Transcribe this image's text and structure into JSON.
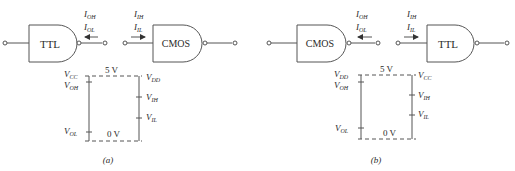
{
  "figure": {
    "panels": [
      {
        "id": "a",
        "caption": "(a)",
        "driver_gate": {
          "label": "TTL",
          "type": "NAND"
        },
        "load_gate": {
          "label": "CMOS",
          "type": "NAND"
        },
        "output_currents": {
          "line1": "I",
          "sub1": "OH",
          "line2": "I",
          "sub2": "OL",
          "arrow": "left"
        },
        "input_currents": {
          "line1": "I",
          "sub1": "IH",
          "line2": "I",
          "sub2": "IL",
          "arrow": "right"
        },
        "levels": {
          "top_label": "5 V",
          "bottom_label": "0 V",
          "left": [
            {
              "name": "V",
              "sub": "CC"
            },
            {
              "name": "V",
              "sub": "OH"
            },
            {
              "name": "V",
              "sub": "OL"
            }
          ],
          "right": [
            {
              "name": "V",
              "sub": "DD"
            },
            {
              "name": "V",
              "sub": "IH"
            },
            {
              "name": "V",
              "sub": "IL"
            }
          ]
        }
      },
      {
        "id": "b",
        "caption": "(b)",
        "driver_gate": {
          "label": "CMOS",
          "type": "NAND"
        },
        "load_gate": {
          "label": "TTL",
          "type": "NAND"
        },
        "output_currents": {
          "line1": "I",
          "sub1": "OH",
          "line2": "I",
          "sub2": "OL",
          "arrow": "left"
        },
        "input_currents": {
          "line1": "I",
          "sub1": "IH",
          "line2": "I",
          "sub2": "IL",
          "arrow": "right"
        },
        "levels": {
          "top_label": "5 V",
          "bottom_label": "0 V",
          "left": [
            {
              "name": "V",
              "sub": "DD"
            },
            {
              "name": "V",
              "sub": "OH"
            },
            {
              "name": "V",
              "sub": "OL"
            }
          ],
          "right": [
            {
              "name": "V",
              "sub": "CC"
            },
            {
              "name": "V",
              "sub": "IH"
            },
            {
              "name": "V",
              "sub": "IL"
            }
          ]
        }
      }
    ]
  }
}
